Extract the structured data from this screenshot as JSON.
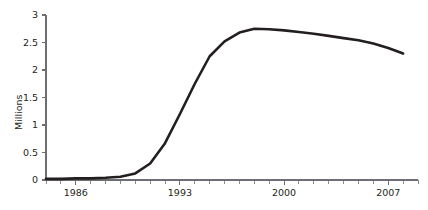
{
  "chart_data": {
    "type": "line",
    "title": "",
    "xlabel": "",
    "ylabel": "Millions",
    "xlim": [
      1984,
      2009
    ],
    "ylim": [
      0,
      3
    ],
    "grid": false,
    "legend": null,
    "y_ticks": [
      "0",
      "0.5",
      "1",
      "1.5",
      "2",
      "2.5",
      "3"
    ],
    "y_tick_values": [
      0,
      0.5,
      1,
      1.5,
      2,
      2.5,
      3
    ],
    "x_ticks": [
      "1986",
      "1993",
      "2000",
      "2007"
    ],
    "x_tick_values": [
      1986,
      1993,
      2000,
      2007
    ],
    "x_minor_step": 1,
    "series": [
      {
        "name": "series-1",
        "color": "#231f20",
        "x": [
          1984,
          1985,
          1986,
          1987,
          1988,
          1989,
          1990,
          1991,
          1992,
          1993,
          1994,
          1995,
          1996,
          1997,
          1998,
          1999,
          2000,
          2001,
          2002,
          2003,
          2004,
          2005,
          2006,
          2007,
          2008
        ],
        "values": [
          0.02,
          0.02,
          0.03,
          0.03,
          0.04,
          0.06,
          0.12,
          0.3,
          0.67,
          1.2,
          1.75,
          2.25,
          2.52,
          2.68,
          2.75,
          2.74,
          2.72,
          2.69,
          2.66,
          2.62,
          2.58,
          2.54,
          2.48,
          2.4,
          2.3
        ]
      }
    ]
  },
  "axis": {
    "y_title": "Millions"
  }
}
